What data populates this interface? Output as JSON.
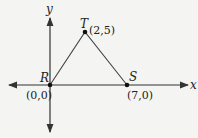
{
  "diagram": {
    "type": "coordinate-plane-triangle",
    "axes": {
      "x_label": "x",
      "y_label": "y"
    },
    "points": [
      {
        "name": "R",
        "coord": "(0,0)"
      },
      {
        "name": "S",
        "coord": "(7,0)"
      },
      {
        "name": "T",
        "coord": "(2,5)"
      }
    ],
    "colors": {
      "line": "#333333",
      "background": "#f4f4f2"
    }
  }
}
